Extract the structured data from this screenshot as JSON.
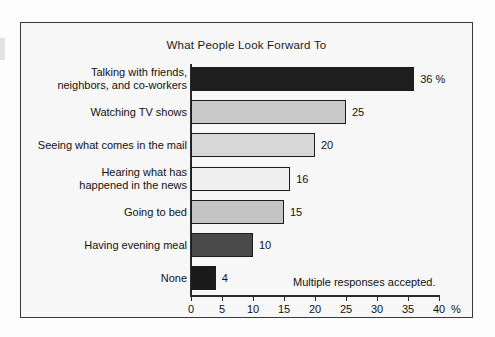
{
  "chart_data": {
    "type": "bar",
    "orientation": "horizontal",
    "title": "What People Look Forward To",
    "xlabel": "%",
    "ylabel": "",
    "xlim": [
      0,
      40
    ],
    "grid": false,
    "legend": null,
    "annotation": "Multiple responses accepted.",
    "axis_unit_label": "%",
    "tick_labels": [
      "0",
      "5",
      "10",
      "15",
      "20",
      "25",
      "30",
      "35",
      "40"
    ],
    "ticks": [
      0,
      5,
      10,
      15,
      20,
      25,
      30,
      35,
      40
    ],
    "categories": [
      "Talking with friends,\nneighbors, and co-workers",
      "Watching TV shows",
      "Seeing what comes in the mail",
      "Hearing what has\nhappened in the news",
      "Going to bed",
      "Having evening meal",
      "None"
    ],
    "values": [
      36,
      25,
      20,
      16,
      15,
      10,
      4
    ],
    "value_labels": [
      "36 %",
      "25",
      "20",
      "16",
      "15",
      "10",
      "4"
    ],
    "bar_colors": [
      "#1e1e1e",
      "#c9c9c9",
      "#d7d7d7",
      "#efefef",
      "#c4c4c4",
      "#4a4a4a",
      "#1a1a1a"
    ],
    "bar_border_color": "#1c1c1c"
  },
  "bars": [
    {
      "label_line1": "Talking with friends,",
      "label_line2": "neighbors, and co-workers",
      "value": 36,
      "value_label": "36 %",
      "color": "#1e1e1e"
    },
    {
      "label_line1": "Watching TV shows",
      "label_line2": "",
      "value": 25,
      "value_label": "25",
      "color": "#c9c9c9"
    },
    {
      "label_line1": "Seeing what comes in the mail",
      "label_line2": "",
      "value": 20,
      "value_label": "20",
      "color": "#d7d7d7"
    },
    {
      "label_line1": "Hearing what has",
      "label_line2": "happened in the news",
      "value": 16,
      "value_label": "16",
      "color": "#efefef"
    },
    {
      "label_line1": "Going to bed",
      "label_line2": "",
      "value": 15,
      "value_label": "15",
      "color": "#c4c4c4"
    },
    {
      "label_line1": "Having evening meal",
      "label_line2": "",
      "value": 10,
      "value_label": "10",
      "color": "#4a4a4a"
    },
    {
      "label_line1": "None",
      "label_line2": "",
      "value": 4,
      "value_label": "4",
      "color": "#1a1a1a"
    }
  ],
  "colors": {
    "frame_border": "#3a3a3a",
    "plot_background": "#f7f7f7",
    "axis": "#2a2a2a",
    "text": "#111111"
  }
}
